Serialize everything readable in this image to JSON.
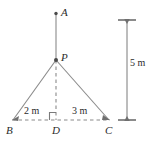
{
  "figure": {
    "type": "geometry-diagram",
    "stroke_color": "#808080",
    "text_color": "#2b2b2b",
    "background_color": "#ffffff",
    "points": [
      {
        "id": "A",
        "label": "A",
        "x": 56,
        "y": 13,
        "marker": "dot"
      },
      {
        "id": "P",
        "label": "P",
        "x": 56,
        "y": 60,
        "marker": "dot"
      },
      {
        "id": "B",
        "label": "B",
        "x": 12,
        "y": 120,
        "marker": "arrow"
      },
      {
        "id": "D",
        "label": "D",
        "x": 56,
        "y": 120,
        "marker": "none"
      },
      {
        "id": "C",
        "label": "C",
        "x": 110,
        "y": 120,
        "marker": "arrow"
      }
    ],
    "segments": [
      {
        "id": "AP",
        "from": "A",
        "to": "P",
        "style": "solid"
      },
      {
        "id": "PD",
        "from": "P",
        "to": "D",
        "style": "dashed"
      },
      {
        "id": "PB",
        "from": "P",
        "to": "B",
        "style": "solid"
      },
      {
        "id": "PC",
        "from": "P",
        "to": "C",
        "style": "solid"
      },
      {
        "id": "BC",
        "from": "B",
        "to": "C",
        "style": "dashed"
      }
    ],
    "right_angle": {
      "at": "D",
      "between": [
        "DB",
        "DP"
      ]
    },
    "dimensions": [
      {
        "id": "BD",
        "label": "2 m",
        "value": 2,
        "unit": "m",
        "from": "B",
        "to": "D"
      },
      {
        "id": "DC",
        "label": "3 m",
        "value": 3,
        "unit": "m",
        "from": "D",
        "to": "C"
      },
      {
        "id": "vertical",
        "label": "5 m",
        "value": 5,
        "unit": "m",
        "orientation": "vertical",
        "position": "right",
        "top_y": 20,
        "bottom_y": 120,
        "x": 127
      }
    ]
  }
}
